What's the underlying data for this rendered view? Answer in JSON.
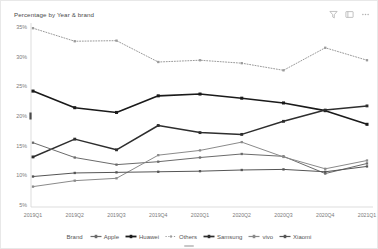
{
  "header": {
    "title": "Percentage by Year & brand",
    "toolbar": [
      {
        "name": "filter-icon",
        "label": "Filter"
      },
      {
        "name": "focus-mode-icon",
        "label": "Focus mode"
      },
      {
        "name": "more-options-icon",
        "label": "More options"
      }
    ]
  },
  "legend": {
    "title": "Brand",
    "items": [
      {
        "label": "Apple",
        "color": "#6b6b6b",
        "style": "solid",
        "width": 1.0
      },
      {
        "label": "Huawei",
        "color": "#1a1a1a",
        "style": "solid",
        "width": 1.6
      },
      {
        "label": "Others",
        "color": "#9a9a9a",
        "style": "dotted",
        "width": 1.0
      },
      {
        "label": "Samsung",
        "color": "#2e2e2e",
        "style": "solid",
        "width": 1.5
      },
      {
        "label": "vivo",
        "color": "#8a8a8a",
        "style": "solid",
        "width": 1.0
      },
      {
        "label": "Xiaomi",
        "color": "#555555",
        "style": "solid",
        "width": 1.0
      }
    ]
  },
  "chart_data": {
    "type": "line",
    "title": "Percentage by Year & brand",
    "xlabel": "",
    "ylabel": "",
    "grid": false,
    "legend_position": "bottom",
    "ylim": [
      5,
      35
    ],
    "ytick_labels": [
      "35%",
      "30%",
      "25%",
      "20%",
      "15%",
      "10%",
      "5%"
    ],
    "ytick_values": [
      35,
      30,
      25,
      20,
      15,
      10,
      5
    ],
    "categories": [
      "2019Q1",
      "2019Q2",
      "2019Q3",
      "2019Q4",
      "2020Q1",
      "2020Q2",
      "2020Q3",
      "2020Q4",
      "2021Q1"
    ],
    "series": [
      {
        "name": "Others",
        "color": "#9a9a9a",
        "style": "dotted",
        "width": 1.0,
        "marker": "square",
        "values": [
          34.8,
          32.6,
          32.7,
          29.1,
          29.4,
          28.9,
          27.7,
          31.5,
          29.4
        ]
      },
      {
        "name": "Huawei",
        "color": "#1a1a1a",
        "style": "solid",
        "width": 1.6,
        "marker": "square",
        "values": [
          24.2,
          21.4,
          20.6,
          23.4,
          23.7,
          23.0,
          22.2,
          20.9,
          18.6
        ]
      },
      {
        "name": "Samsung",
        "color": "#2e2e2e",
        "style": "solid",
        "width": 1.5,
        "marker": "square",
        "values": [
          13.1,
          16.1,
          14.3,
          18.4,
          17.2,
          16.9,
          19.1,
          21.0,
          21.7
        ]
      },
      {
        "name": "Apple",
        "color": "#6b6b6b",
        "style": "solid",
        "width": 1.0,
        "marker": "square",
        "values": [
          15.5,
          13.0,
          11.8,
          12.3,
          13.0,
          13.6,
          13.2,
          10.3,
          12.0
        ]
      },
      {
        "name": "vivo",
        "color": "#8a8a8a",
        "style": "solid",
        "width": 1.0,
        "marker": "square",
        "values": [
          8.1,
          9.1,
          9.5,
          13.4,
          14.2,
          15.6,
          13.1,
          11.1,
          12.5
        ]
      },
      {
        "name": "Xiaomi",
        "color": "#555555",
        "style": "solid",
        "width": 1.0,
        "marker": "square",
        "values": [
          9.8,
          10.4,
          10.5,
          10.6,
          10.7,
          10.9,
          11.0,
          10.6,
          11.5
        ]
      }
    ]
  }
}
